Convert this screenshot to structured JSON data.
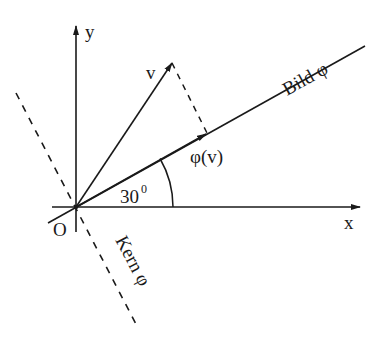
{
  "diagram": {
    "title": "",
    "colors": {
      "ink": "#1a1a1a",
      "background": "#ffffff"
    },
    "axes": {
      "x_label": "x",
      "y_label": "y",
      "origin_label": "O"
    },
    "vectors": {
      "v_label": "v",
      "phi_v_label": "φ(v)"
    },
    "lines": {
      "image_label": "Bild φ",
      "kernel_label": "Kern φ"
    },
    "angle": {
      "label_value": "30",
      "label_degree": "0",
      "degrees": 30
    }
  }
}
